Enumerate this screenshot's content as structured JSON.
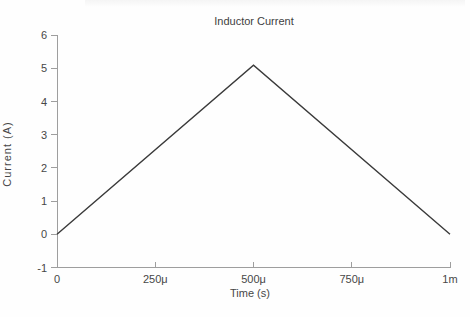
{
  "figure": {
    "background": "#fefefe"
  },
  "chart_data": {
    "type": "line",
    "title": "Inductor Current",
    "xlabel": "Time (s)",
    "ylabel": "Current (A)",
    "xlim": [
      0,
      0.001
    ],
    "ylim": [
      -1,
      6
    ],
    "grid": false,
    "legend": "none",
    "x_ticks": [
      {
        "value": 0,
        "label": "0"
      },
      {
        "value": 0.00025,
        "label": "250μ"
      },
      {
        "value": 0.0005,
        "label": "500μ"
      },
      {
        "value": 0.00075,
        "label": "750μ"
      },
      {
        "value": 0.001,
        "label": "1m"
      }
    ],
    "y_ticks": [
      {
        "value": -1,
        "label": "-1"
      },
      {
        "value": 0,
        "label": "0"
      },
      {
        "value": 1,
        "label": "1"
      },
      {
        "value": 2,
        "label": "2"
      },
      {
        "value": 3,
        "label": "3"
      },
      {
        "value": 4,
        "label": "4"
      },
      {
        "value": 5,
        "label": "5"
      },
      {
        "value": 6,
        "label": "6"
      }
    ],
    "series": [
      {
        "name": "inductor-current",
        "color": "#3a3a3a",
        "points": [
          [
            0,
            0
          ],
          [
            0.0005,
            5.1
          ],
          [
            0.001,
            0
          ]
        ]
      }
    ],
    "colors": {
      "axis": "#9e9e9e",
      "text": "#474747",
      "line": "#3a3a3a"
    }
  }
}
